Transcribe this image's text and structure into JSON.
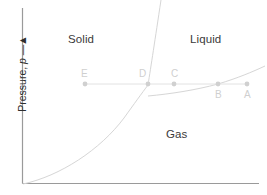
{
  "figure": {
    "type": "phase-diagram",
    "axes": {
      "y_label_text": "Pressure,",
      "y_label_symbol": "p",
      "y_label_arrow": "↑",
      "y_label_full": "Pressure, p →",
      "x_label": "",
      "axis_color": "#9a9a9a"
    },
    "regions": [
      {
        "id": "solid",
        "label": "Solid",
        "x": 68,
        "y": 33
      },
      {
        "id": "liquid",
        "label": "Liquid",
        "x": 190,
        "y": 33
      },
      {
        "id": "gas",
        "label": "Gas",
        "x": 166,
        "y": 128
      }
    ],
    "points": [
      {
        "id": "E",
        "label": "E",
        "x": 85,
        "y": 84,
        "label_dx": -4,
        "label_dy": -16
      },
      {
        "id": "D",
        "label": "D",
        "x": 148,
        "y": 84,
        "label_dx": -9,
        "label_dy": -16
      },
      {
        "id": "C",
        "label": "C",
        "x": 174,
        "y": 84,
        "label_dx": -3,
        "label_dy": -16
      },
      {
        "id": "B",
        "label": "B",
        "x": 218,
        "y": 84,
        "label_dx": -3,
        "label_dy": 5
      },
      {
        "id": "A",
        "label": "A",
        "x": 247,
        "y": 84,
        "label_dx": -3,
        "label_dy": 5
      }
    ],
    "isobar": {
      "id": "isobar-line",
      "y": 84,
      "x_start": 85,
      "x_end": 247
    },
    "curves": [
      {
        "id": "sublimation-curve",
        "name": "sublimation",
        "path": "M 23 184 C 60 176, 100 150, 124 118 C 134 104, 142 93, 148 85"
      },
      {
        "id": "fusion-curve",
        "name": "fusion",
        "path": "M 148 85 C 151 66, 155 40, 161 0"
      },
      {
        "id": "vaporization-curve",
        "name": "vaporization",
        "path": "M 148 96 C 170 94, 196 90, 218 84 C 238 78, 252 72, 265 66"
      }
    ],
    "colors": {
      "curve": "#d6d6d6",
      "isobar": "#e2e2e2",
      "marker": "#d0d0d0",
      "point_label": "#cfcfcf",
      "region_label": "#3a3a3a",
      "axis": "#9a9a9a",
      "background": "#ffffff"
    }
  },
  "chart_data": {
    "type": "line",
    "title": "",
    "xlabel": "",
    "ylabel": "Pressure, p",
    "grid": false,
    "legend": "none",
    "annotations": [
      "Solid",
      "Liquid",
      "Gas",
      "A",
      "B",
      "C",
      "D",
      "E"
    ],
    "series": [
      {
        "name": "sublimation",
        "x": [
          23,
          60,
          100,
          124,
          134,
          142,
          148
        ],
        "y": [
          184,
          176,
          150,
          118,
          104,
          93,
          85
        ]
      },
      {
        "name": "fusion",
        "x": [
          148,
          151,
          155,
          161
        ],
        "y": [
          85,
          66,
          40,
          0
        ]
      },
      {
        "name": "vaporization",
        "x": [
          148,
          170,
          196,
          218,
          238,
          252,
          265
        ],
        "y": [
          96,
          94,
          90,
          84,
          78,
          72,
          66
        ]
      },
      {
        "name": "isobar",
        "x": [
          85,
          148,
          174,
          218,
          247
        ],
        "y": [
          84,
          84,
          84,
          84,
          84
        ]
      }
    ]
  }
}
